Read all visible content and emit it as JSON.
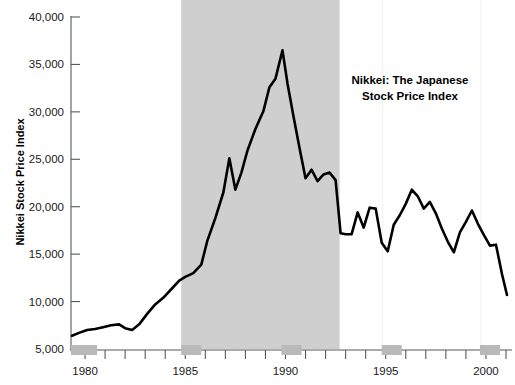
{
  "chart_data": {
    "type": "line",
    "title": "Nikkei: The Japanese Stock Price Index",
    "title_line1": "Nikkei: The Japanese",
    "title_line2": "Stock Price Index",
    "xlabel": "",
    "ylabel": "Nikkei Stock Price Index",
    "xlim": [
      1979.3,
      2001.2
    ],
    "ylim": [
      5000,
      40000
    ],
    "grid": false,
    "legend": null,
    "ytick_labels": [
      "40,000",
      "35,000",
      "30,000",
      "25,000",
      "20,000",
      "15,000",
      "10,000",
      "5,000"
    ],
    "ytick_values": [
      40000,
      35000,
      30000,
      25000,
      20000,
      15000,
      10000,
      5000
    ],
    "xtick_labels": [
      "1980",
      "1985",
      "1990",
      "1995",
      "2000"
    ],
    "xtick_values": [
      1980,
      1985,
      1990,
      1995,
      2000
    ],
    "xtick_minor_values": [
      1981,
      1982,
      1983,
      1984,
      1986,
      1987,
      1988,
      1989,
      1991,
      1992,
      1993,
      1994,
      1996,
      1997,
      1998,
      1999,
      2001
    ],
    "line_color": "#000000",
    "band_color": "#cfcfcf",
    "recession_bar_color": "#b9b9b9",
    "shaded_bands": [
      {
        "name": "bubble-period-band",
        "x_start": 1984.8,
        "x_end": 1992.7
      }
    ],
    "axis_recession_bars": [
      {
        "name": "recession-bar-1980",
        "x_start": 1979.3,
        "x_end": 1980.6
      },
      {
        "name": "recession-bar-1985",
        "x_start": 1984.8,
        "x_end": 1985.8
      },
      {
        "name": "recession-bar-1990",
        "x_start": 1989.8,
        "x_end": 1990.8
      },
      {
        "name": "recession-bar-1995",
        "x_start": 1994.8,
        "x_end": 1995.8
      },
      {
        "name": "recession-bar-2000",
        "x_start": 1999.7,
        "x_end": 2000.7
      }
    ],
    "x": [
      1979.35,
      1979.7,
      1980.1,
      1980.5,
      1980.9,
      1981.3,
      1981.7,
      1982.0,
      1982.35,
      1982.7,
      1983.1,
      1983.5,
      1983.9,
      1984.3,
      1984.7,
      1985.0,
      1985.4,
      1985.8,
      1986.1,
      1986.5,
      1986.9,
      1987.2,
      1987.5,
      1987.8,
      1988.1,
      1988.5,
      1988.9,
      1989.2,
      1989.5,
      1989.85,
      1990.1,
      1990.4,
      1990.7,
      1991.0,
      1991.3,
      1991.6,
      1991.9,
      1992.2,
      1992.5,
      1992.75,
      1993.0,
      1993.3,
      1993.6,
      1993.9,
      1994.2,
      1994.5,
      1994.8,
      1995.1,
      1995.4,
      1995.7,
      1996.0,
      1996.3,
      1996.6,
      1996.9,
      1997.2,
      1997.5,
      1997.8,
      1998.1,
      1998.4,
      1998.7,
      1999.0,
      1999.3,
      1999.6,
      1999.9,
      2000.2,
      2000.5,
      2000.8,
      2001.05
    ],
    "y": [
      6400,
      6700,
      7000,
      7100,
      7300,
      7500,
      7600,
      7200,
      7000,
      7600,
      8700,
      9700,
      10400,
      11300,
      12200,
      12600,
      13000,
      13900,
      16400,
      18800,
      21500,
      25100,
      21800,
      23600,
      25900,
      28200,
      30100,
      32600,
      33500,
      36500,
      33000,
      29500,
      26200,
      23000,
      23900,
      22700,
      23400,
      23600,
      22800,
      17200,
      17100,
      17100,
      19400,
      17800,
      19900,
      19800,
      16200,
      15300,
      18100,
      19100,
      20300,
      21800,
      21100,
      19800,
      20500,
      19300,
      17700,
      16300,
      15200,
      17300,
      18400,
      19600,
      18200,
      17000,
      15900,
      16000,
      12900,
      10700
    ],
    "annotations": [
      {
        "name": "chart-title-annotation",
        "text": "Nikkei: The Japanese Stock Price Index",
        "x": 1998.0,
        "y": 31500
      }
    ]
  },
  "figure": {
    "background": "#ffffff",
    "plot_left_px": 71,
    "plot_right_px": 510,
    "plot_top_px": 17,
    "plot_bottom_px": 349
  }
}
